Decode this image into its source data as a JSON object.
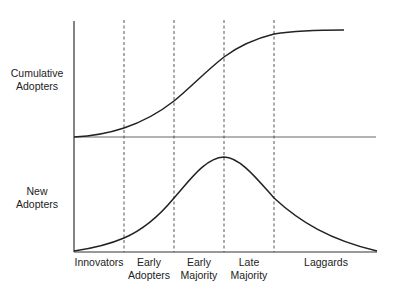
{
  "diagram": {
    "upper_panel": {
      "y_label_line1": "Cumulative",
      "y_label_line2": "Adopters",
      "curve": "S-shaped cumulative adoption curve"
    },
    "lower_panel": {
      "y_label_line1": "New",
      "y_label_line2": "Adopters",
      "curve": "Bell-shaped new adopters curve, peak at boundary between Early Majority and Late Majority"
    },
    "categories": [
      {
        "line1": "Innovators",
        "line2": ""
      },
      {
        "line1": "Early",
        "line2": "Adopters"
      },
      {
        "line1": "Early",
        "line2": "Majority"
      },
      {
        "line1": "Late",
        "line2": "Majority"
      },
      {
        "line1": "Laggards",
        "line2": ""
      }
    ],
    "colors": {
      "line": "#222222",
      "axis": "#333333",
      "midline": "#666666",
      "divider": "#444444"
    }
  }
}
